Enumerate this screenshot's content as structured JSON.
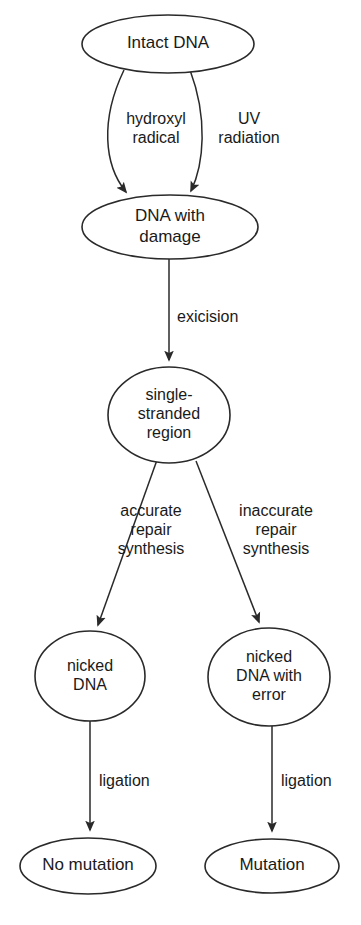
{
  "diagram": {
    "type": "flowchart",
    "background_color": "#ffffff",
    "stroke_color": "#2a2a2a",
    "text_color": "#1a1a1a",
    "nodes": [
      {
        "id": "intact-dna",
        "lines": [
          "Intact DNA"
        ],
        "shape": "ellipse",
        "cx": 168,
        "cy": 44,
        "rx": 86,
        "ry": 29,
        "font_size": 17
      },
      {
        "id": "dna-with-damage",
        "lines": [
          "DNA with",
          "damage"
        ],
        "shape": "ellipse",
        "cx": 170,
        "cy": 227,
        "rx": 88,
        "ry": 32,
        "font_size": 17
      },
      {
        "id": "single-stranded-region",
        "lines": [
          "single-",
          "stranded",
          "region"
        ],
        "shape": "ellipse",
        "cx": 169,
        "cy": 415,
        "rx": 61,
        "ry": 48,
        "font_size": 16
      },
      {
        "id": "nicked-dna",
        "lines": [
          "nicked",
          "DNA"
        ],
        "shape": "ellipse",
        "cx": 90,
        "cy": 676,
        "rx": 55,
        "ry": 45,
        "font_size": 16
      },
      {
        "id": "nicked-dna-with-error",
        "lines": [
          "nicked",
          "DNA with",
          "error"
        ],
        "shape": "ellipse",
        "cx": 269,
        "cy": 677,
        "rx": 61,
        "ry": 49,
        "font_size": 16
      },
      {
        "id": "no-mutation",
        "lines": [
          "No mutation"
        ],
        "shape": "ellipse",
        "cx": 88,
        "cy": 866,
        "rx": 68,
        "ry": 28,
        "font_size": 17
      },
      {
        "id": "mutation",
        "lines": [
          "Mutation"
        ],
        "shape": "ellipse",
        "cx": 272,
        "cy": 866,
        "rx": 67,
        "ry": 27,
        "font_size": 17
      }
    ],
    "edges": [
      {
        "id": "edge-hydroxyl-radical",
        "from": "intact-dna",
        "to": "dna-with-damage",
        "path": "M 124 70 C 100 120, 104 165, 126 192",
        "arrow": true,
        "label_lines": [
          "hydroxyl",
          "radical"
        ],
        "label_x": 156,
        "label_y": 129,
        "label_anchor": "middle",
        "font_size": 16
      },
      {
        "id": "edge-uv-radiation",
        "from": "intact-dna",
        "to": "dna-with-damage",
        "path": "M 190 70 C 208 118, 204 164, 191 191",
        "arrow": true,
        "label_lines": [
          "UV",
          "radiation"
        ],
        "label_x": 249,
        "label_y": 129,
        "label_anchor": "middle",
        "font_size": 16
      },
      {
        "id": "edge-excision",
        "from": "dna-with-damage",
        "to": "single-stranded-region",
        "path": "M 169 259 L 169 360",
        "arrow": true,
        "label_lines": [
          "exicision"
        ],
        "label_x": 177,
        "label_y": 318,
        "label_anchor": "start",
        "font_size": 16
      },
      {
        "id": "edge-accurate-repair-synthesis",
        "from": "single-stranded-region",
        "to": "nicked-dna",
        "path": "M 157 460 L 98 625",
        "arrow": true,
        "label_lines": [
          "accurate",
          "repair",
          "synthesis"
        ],
        "label_x": 151,
        "label_y": 531,
        "label_anchor": "middle",
        "font_size": 16
      },
      {
        "id": "edge-inaccurate-repair-synthesis",
        "from": "single-stranded-region",
        "to": "nicked-dna-with-error",
        "path": "M 196 461 L 259 622",
        "arrow": true,
        "label_lines": [
          "inaccurate",
          "repair",
          "synthesis"
        ],
        "label_x": 276,
        "label_y": 531,
        "label_anchor": "middle",
        "font_size": 16
      },
      {
        "id": "edge-ligation-left",
        "from": "nicked-dna",
        "to": "no-mutation",
        "path": "M 90 721 L 90 830",
        "arrow": true,
        "label_lines": [
          "ligation"
        ],
        "label_x": 99,
        "label_y": 782,
        "label_anchor": "start",
        "font_size": 16
      },
      {
        "id": "edge-ligation-right",
        "from": "nicked-dna-with-error",
        "to": "mutation",
        "path": "M 272 726 L 272 831",
        "arrow": true,
        "label_lines": [
          "ligation"
        ],
        "label_x": 281,
        "label_y": 782,
        "label_anchor": "start",
        "font_size": 16
      }
    ]
  }
}
